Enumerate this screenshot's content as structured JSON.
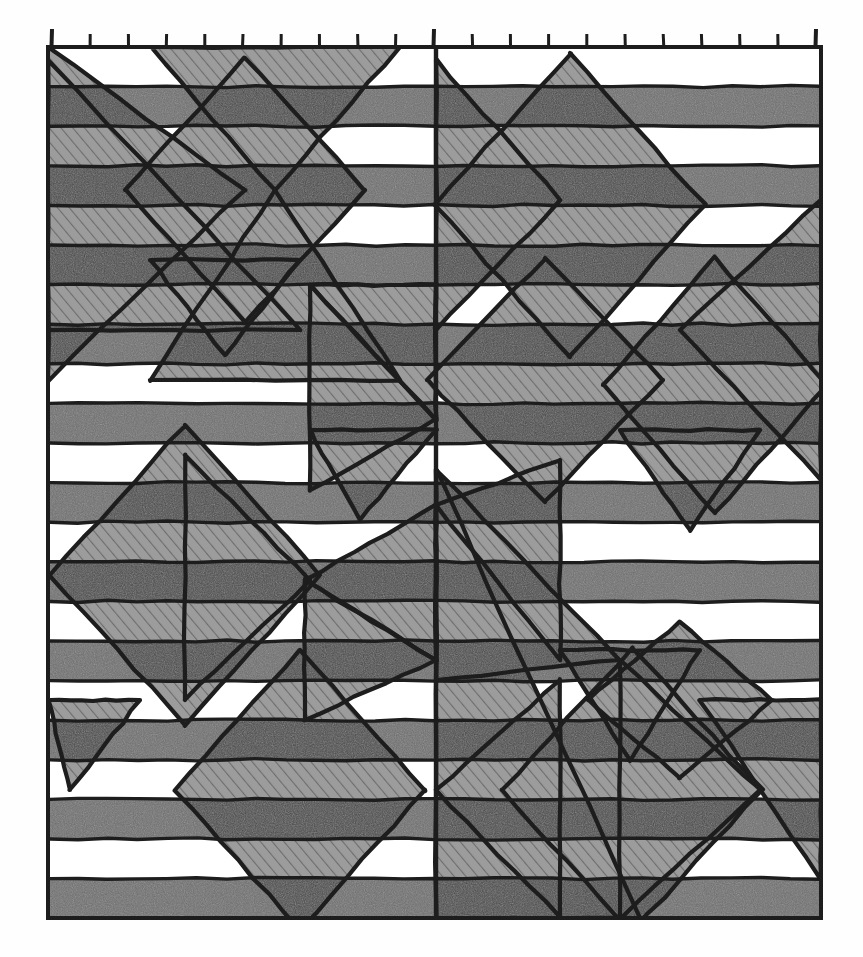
{
  "artwork": {
    "title": "Striped Geometric Quilt Pattern Drawing",
    "medium": "graphite / ink line drawing",
    "canvas": {
      "width": 863,
      "height": 957
    },
    "frame": {
      "x": 48,
      "y": 47,
      "width": 773,
      "height": 871,
      "stroke": "#1d1d1d",
      "stroke_width": 4
    },
    "palette": {
      "paper": "#fefefe",
      "white_band": "#ffffff",
      "gray_band": "#6f6f6f",
      "light_overlay": "#9c9c9c",
      "dark_overlay": "#4a4a4a",
      "ink": "#1d1d1d",
      "hatch": "#6a6a6a"
    },
    "top_ruler": {
      "label": "tick-marks along top edge",
      "count": 21,
      "tick_height": 13,
      "tall_tick_indices": [
        0,
        10,
        20
      ],
      "start_x": 52,
      "spacing": 38.2
    },
    "stripes": {
      "count": 22,
      "band_height": 39.6,
      "first_band_color": "white_band",
      "order": [
        "white",
        "gray",
        "white",
        "gray",
        "white",
        "gray",
        "white",
        "gray",
        "white",
        "gray",
        "white",
        "gray",
        "white",
        "gray",
        "white",
        "gray",
        "white",
        "gray",
        "white",
        "gray",
        "white",
        "gray"
      ]
    },
    "center_rule": {
      "label": "vertical centre line",
      "x": 436,
      "y1": 47,
      "y2": 918
    },
    "shapes": [
      {
        "name": "diamond-upper-right",
        "type": "diamond",
        "cx": 570,
        "cy": 205,
        "rx": 135,
        "ry": 152
      },
      {
        "name": "diamond-mid-right",
        "type": "diamond",
        "cx": 700,
        "cy": 380,
        "rx": 128,
        "ry": 140
      },
      {
        "name": "diamond-mid-centre",
        "type": "diamond",
        "cx": 545,
        "cy": 380,
        "rx": 120,
        "ry": 132
      },
      {
        "name": "diamond-lower-left",
        "type": "diamond",
        "cx": 185,
        "cy": 575,
        "rx": 135,
        "ry": 150
      },
      {
        "name": "diamond-lower-centre",
        "type": "diamond",
        "cx": 300,
        "cy": 790,
        "rx": 125,
        "ry": 140
      },
      {
        "name": "diamond-lower-right",
        "type": "diamond",
        "cx": 632,
        "cy": 790,
        "rx": 130,
        "ry": 142
      },
      {
        "name": "x-cross-upper-left",
        "type": "cross",
        "cx": 245,
        "cy": 190
      },
      {
        "name": "x-cross-lower-centre",
        "type": "cross",
        "cx": 305,
        "cy": 580
      },
      {
        "name": "x-cross-lower-right",
        "type": "cross",
        "cx": 630,
        "cy": 790
      }
    ]
  },
  "meta": {
    "domain_note": "hand-drawn geometric textile / quilt block pattern study"
  }
}
